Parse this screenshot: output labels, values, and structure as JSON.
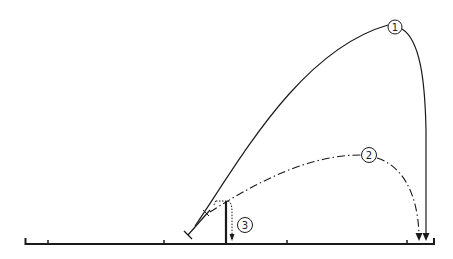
{
  "diagram": {
    "type": "trajectory-diagram",
    "colors": {
      "ink": "#1a1a1a",
      "background": "#ffffff"
    },
    "trajectories": [
      {
        "id": "1",
        "label": "1",
        "style": "solid",
        "description": "High-arc trajectory"
      },
      {
        "id": "2",
        "label": "2",
        "style": "dash-dot",
        "description": "Lower-arc trajectory"
      },
      {
        "id": "3",
        "label": "3",
        "style": "dotted",
        "description": "Short drop near launch point"
      }
    ],
    "ground": {
      "tick_count": 7
    }
  }
}
